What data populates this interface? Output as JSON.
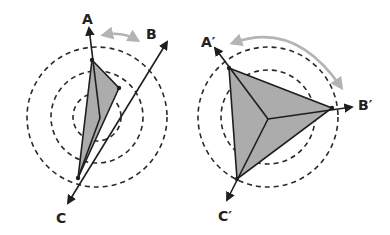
{
  "figure": {
    "colors": {
      "background": "#ffffff",
      "fill": "#acacac",
      "stroke": "#1e1e1e",
      "rotation_arrow": "#b4b4b4"
    }
  },
  "left": {
    "labels": {
      "a": "A",
      "b": "B",
      "c": "C"
    },
    "center": [
      97,
      117
    ],
    "radii": [
      24,
      46,
      70
    ],
    "vertex_center": [
      100,
      118
    ],
    "points": {
      "a": [
        92,
        60
      ],
      "b": [
        119,
        88
      ],
      "c": [
        78,
        178
      ]
    },
    "arrows": {
      "a": [
        89,
        28
      ],
      "b": [
        167,
        42
      ],
      "c": [
        68,
        203
      ]
    },
    "rotation_arrow": "double-headed arc between A and B"
  },
  "right": {
    "labels": {
      "a": "A′",
      "b": "B′",
      "c": "C′"
    },
    "center": [
      268,
      117
    ],
    "radii": [
      24,
      47,
      70
    ],
    "vertex_center": [
      268,
      119
    ],
    "points": {
      "a": [
        229,
        68
      ],
      "b": [
        332,
        108
      ],
      "c": [
        237,
        179
      ]
    },
    "arrows": {
      "a": [
        215,
        48
      ],
      "b": [
        352,
        107
      ],
      "c": [
        227,
        200
      ]
    },
    "rotation_arrow": "double-headed arc from A' to B'"
  }
}
